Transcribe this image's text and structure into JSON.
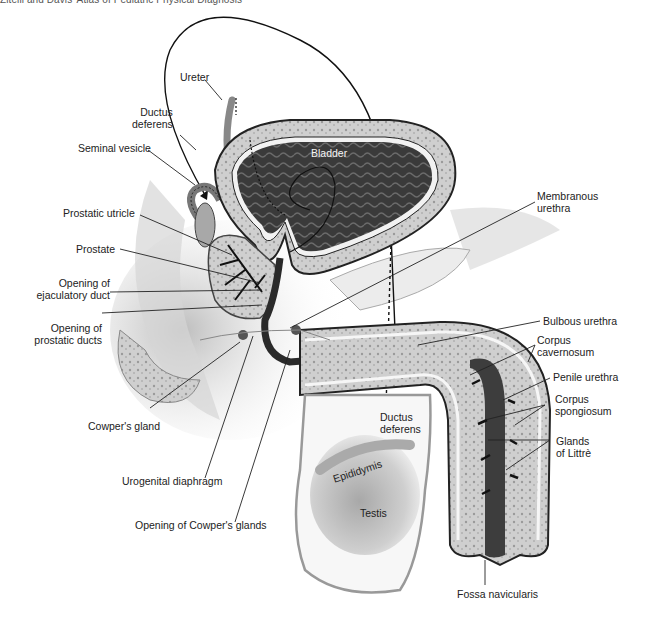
{
  "header": {
    "text": "Zitelli and Davis' Atlas of Pediatric Physical Diagnosis"
  },
  "diagram": {
    "labels": {
      "ureter": {
        "l1": "Ureter"
      },
      "ductus_deferens_top": {
        "l1": "Ductus",
        "l2": "deferens"
      },
      "seminal_vesicle": {
        "l1": "Seminal vesicle"
      },
      "prostatic_utricle": {
        "l1": "Prostatic utricle"
      },
      "prostate": {
        "l1": "Prostate"
      },
      "opening_ejaculatory": {
        "l1": "Opening of",
        "l2": "ejaculatory duct"
      },
      "opening_prostatic": {
        "l1": "Opening of",
        "l2": "prostatic ducts"
      },
      "cowpers_gland": {
        "l1": "Cowper's gland"
      },
      "urogenital_diaphragm": {
        "l1": "Urogenital diaphragm"
      },
      "opening_cowpers": {
        "l1": "Opening of Cowper's glands"
      },
      "bladder": {
        "l1": "Bladder"
      },
      "membranous_urethra": {
        "l1": "Membranous",
        "l2": "urethra"
      },
      "bulbous_urethra": {
        "l1": "Bulbous urethra"
      },
      "corpus_cavernosum": {
        "l1": "Corpus",
        "l2": "cavernosum"
      },
      "penile_urethra": {
        "l1": "Penile urethra"
      },
      "corpus_spongiosum": {
        "l1": "Corpus",
        "l2": "spongiosum"
      },
      "glands_of_littre": {
        "l1": "Glands",
        "l2": "of Littrè"
      },
      "ductus_deferens_bottom": {
        "l1": "Ductus",
        "l2": "deferens"
      },
      "epididymis": {
        "l1": "Epididymis"
      },
      "testis": {
        "l1": "Testis"
      },
      "fossa_navicularis": {
        "l1": "Fossa navicularis"
      }
    },
    "colors": {
      "bladder_lumen": "#3a3a3a",
      "tissue_light": "#d8d8d8",
      "tissue_mid": "#a8a8a8",
      "outline": "#333333",
      "urethra": "#2a2a2a",
      "leader": "#222222"
    }
  }
}
